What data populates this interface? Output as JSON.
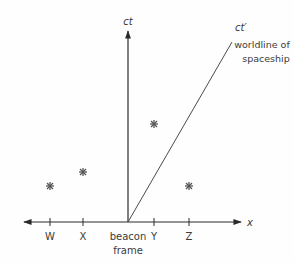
{
  "diagram": {
    "type": "spacetime-diagram",
    "colors": {
      "axis": "#2a2a2a",
      "worldline": "#4a4a4a",
      "event": "#555555",
      "text": "#3a3a3a"
    },
    "axes": {
      "vertical_label": "ct",
      "horizontal_label": "x",
      "origin_label_line1": "beacon",
      "origin_label_line2": "frame"
    },
    "worldline": {
      "axis_label": "ct′",
      "caption_line1": "worldline of",
      "caption_line2": "spaceship"
    },
    "ticks": [
      {
        "label": "W"
      },
      {
        "label": "X"
      },
      {
        "label": "Y"
      },
      {
        "label": "Z"
      }
    ],
    "events": [
      {
        "name": "event-W",
        "symbol": "✳"
      },
      {
        "name": "event-X",
        "symbol": "✳"
      },
      {
        "name": "event-Y",
        "symbol": "✳"
      },
      {
        "name": "event-Z",
        "symbol": "✳"
      }
    ]
  }
}
